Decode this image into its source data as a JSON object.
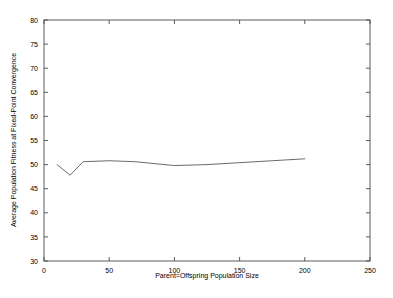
{
  "chart_data": {
    "type": "line",
    "title": "",
    "xlabel": "Parent=Offspring Population Size",
    "ylabel": "Average Population Fitness at Fixed-Point Convergence",
    "xlim": [
      0,
      250
    ],
    "ylim": [
      30,
      80
    ],
    "xticks": [
      0,
      50,
      100,
      150,
      200,
      250
    ],
    "yticks": [
      30,
      35,
      40,
      45,
      50,
      55,
      60,
      65,
      70,
      75,
      80
    ],
    "xtick_labels": [
      "0",
      "50",
      "100",
      "150",
      "200",
      "250"
    ],
    "ytick_labels": [
      "30",
      "35",
      "40",
      "45",
      "50",
      "55",
      "60",
      "65",
      "70",
      "75",
      "80"
    ],
    "grid": false,
    "legend_position": "upper-center",
    "series": [
      {
        "name": "Uniform stochastic selection",
        "color": "#5a5a5a",
        "x": [
          10,
          20,
          30,
          50,
          70,
          100,
          125,
          150,
          200
        ],
        "values": [
          50.0,
          47.8,
          50.6,
          50.8,
          50.6,
          49.8,
          50.0,
          50.4,
          51.2
        ]
      }
    ]
  },
  "legend": {
    "entries": [
      {
        "label": "Uniform stochastic selection"
      }
    ]
  },
  "axes": {
    "x_title": "Parent=Offspring Population Size",
    "y_title": "Average Population Fitness at Fixed-Point Convergence"
  }
}
